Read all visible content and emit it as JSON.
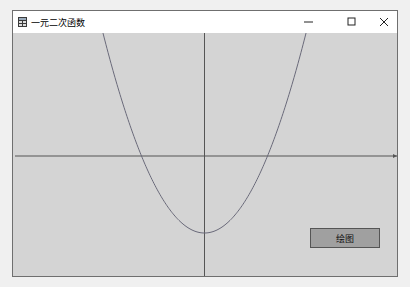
{
  "window": {
    "title": "一元二次函数",
    "controls": {
      "minimize": "—",
      "maximize": "☐",
      "close": "✕"
    }
  },
  "plot": {
    "function": "y = a x^2 + c (parabola opening upward)",
    "background": "#d4d4d4",
    "axis_color": "#555555",
    "curve_color": "#6a6a7a"
  },
  "draw_button": {
    "label": "绘图"
  }
}
